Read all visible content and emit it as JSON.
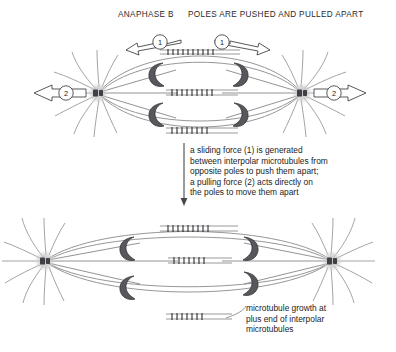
{
  "header": {
    "phase_label": "ANAPHASE B",
    "description": "POLES ARE PUSHED AND PULLED APART"
  },
  "middle_caption": "a sliding force (1) is generated\nbetween interpolar microtubules from\nopposite poles to push them apart;\na pulling force (2) acts directly on\nthe poles to move them apart",
  "bottom_caption": "microtubule growth at\nplus end of interpolar\nmicrotubules",
  "force_labels": {
    "sliding": "1",
    "pulling": "2"
  },
  "diagram_data": {
    "type": "diagram",
    "subject": "mitotic spindle anaphase B",
    "panels": [
      {
        "name": "top-spindle",
        "state": "poles close together",
        "pole_left_x": 98,
        "pole_right_x": 302,
        "pole_y": 93,
        "chromosome_count": 4,
        "overlap_zone_count": 3,
        "sliding_arrow_count": 2,
        "pulling_arrow_count": 2
      },
      {
        "name": "bottom-spindle",
        "state": "poles pushed and pulled apart",
        "pole_left_x": 45,
        "pole_right_x": 332,
        "pole_y": 261,
        "chromosome_count": 4,
        "overlap_zone_count": 3,
        "sliding_arrow_count": 0,
        "pulling_arrow_count": 0
      }
    ],
    "legend_elements": [
      "centrosome pole",
      "astral microtubule",
      "interpolar microtubule",
      "kinetochore microtubule",
      "chromosome",
      "microtubule overlap zone"
    ],
    "colors": {
      "background": "#ffffff",
      "microtubule": "#808083",
      "chromosome": "#58585c",
      "centrosome_halo": "#c9c9cc",
      "centriole": "#404044",
      "overlap_tick": "#232326",
      "text": "#1a1a1a"
    }
  }
}
